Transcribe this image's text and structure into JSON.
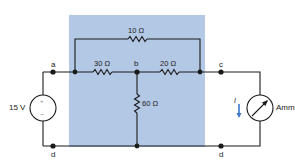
{
  "colors": {
    "panel": "#b3c8e4",
    "wire": "#1a1a1a",
    "current_arrow": "#3a78c9",
    "background": "#ffffff"
  },
  "nodes": {
    "a": "a",
    "b": "b",
    "c": "c",
    "d_left": "d",
    "d_right": "d"
  },
  "components": {
    "source": {
      "type": "voltage-source",
      "label": "15 V",
      "plus": "+",
      "minus": "−"
    },
    "r_top": {
      "type": "resistor",
      "label": "10 Ω"
    },
    "r_ab": {
      "type": "resistor",
      "label": "30 Ω"
    },
    "r_bc": {
      "type": "resistor",
      "label": "20 Ω"
    },
    "r_bd": {
      "type": "resistor",
      "label": "60 Ω"
    },
    "meter": {
      "type": "ammeter",
      "label": "Ammeter",
      "current_label": "I"
    }
  }
}
